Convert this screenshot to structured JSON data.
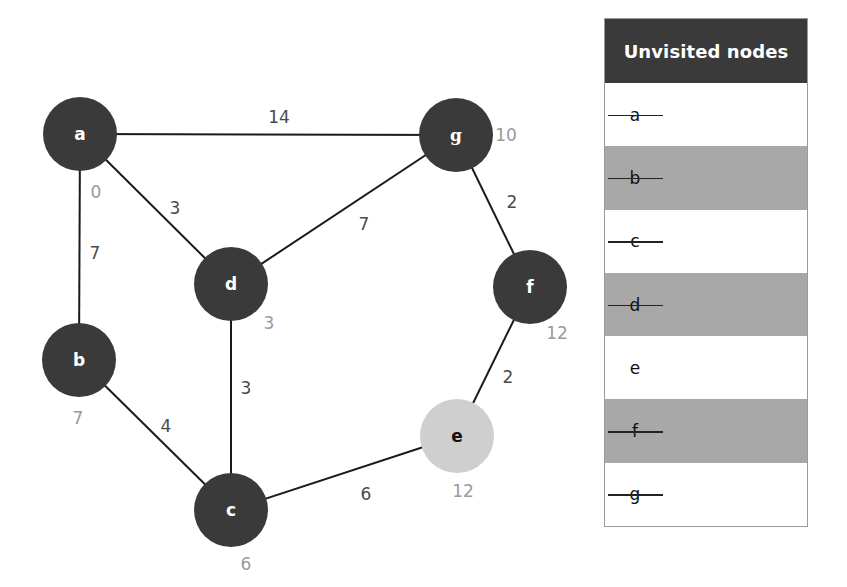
{
  "graph": {
    "nodes": [
      {
        "id": "a",
        "label": "a",
        "x": 80,
        "y": 134,
        "distance": "0",
        "dist_x": 96,
        "dist_y": 198,
        "state": "visited"
      },
      {
        "id": "b",
        "label": "b",
        "x": 79,
        "y": 360,
        "distance": "7",
        "dist_x": 78,
        "dist_y": 424,
        "state": "visited"
      },
      {
        "id": "c",
        "label": "c",
        "x": 231,
        "y": 510,
        "distance": "6",
        "dist_x": 246,
        "dist_y": 570,
        "state": "visited"
      },
      {
        "id": "d",
        "label": "d",
        "x": 231,
        "y": 284,
        "distance": "3",
        "dist_x": 269,
        "dist_y": 329,
        "state": "visited"
      },
      {
        "id": "e",
        "label": "e",
        "x": 457,
        "y": 436,
        "distance": "12",
        "dist_x": 463,
        "dist_y": 497,
        "state": "current"
      },
      {
        "id": "f",
        "label": "f",
        "x": 530,
        "y": 287,
        "distance": "12",
        "dist_x": 557,
        "dist_y": 339,
        "state": "visited"
      },
      {
        "id": "g",
        "label": "g",
        "x": 456,
        "y": 135,
        "distance": "10",
        "dist_x": 506,
        "dist_y": 141,
        "state": "visited"
      }
    ],
    "edges": [
      {
        "from": "a",
        "to": "g",
        "weight": "14",
        "label_x": 279,
        "label_y": 123
      },
      {
        "from": "a",
        "to": "d",
        "weight": "3",
        "label_x": 175,
        "label_y": 214
      },
      {
        "from": "a",
        "to": "b",
        "weight": "7",
        "label_x": 95,
        "label_y": 259
      },
      {
        "from": "d",
        "to": "g",
        "weight": "7",
        "label_x": 364,
        "label_y": 230
      },
      {
        "from": "g",
        "to": "f",
        "weight": "2",
        "label_x": 512,
        "label_y": 208
      },
      {
        "from": "d",
        "to": "c",
        "weight": "3",
        "label_x": 246,
        "label_y": 394
      },
      {
        "from": "b",
        "to": "c",
        "weight": "4",
        "label_x": 166,
        "label_y": 432
      },
      {
        "from": "f",
        "to": "e",
        "weight": "2",
        "label_x": 508,
        "label_y": 383
      },
      {
        "from": "c",
        "to": "e",
        "weight": "6",
        "label_x": 366,
        "label_y": 500
      }
    ],
    "node_radius": 37,
    "colors": {
      "visited_fill": "#3a3a3a",
      "current_fill": "#cfcfcf",
      "edge": "#1a1a1a",
      "weight_text": "#4a4a4a",
      "distance_text": "#9a9a9a"
    }
  },
  "table": {
    "header": "Unvisited nodes",
    "rows": [
      {
        "label": "a",
        "struck": true,
        "shaded": false
      },
      {
        "label": "b",
        "struck": true,
        "shaded": true
      },
      {
        "label": "c",
        "struck": true,
        "shaded": false
      },
      {
        "label": "d",
        "struck": true,
        "shaded": true
      },
      {
        "label": "e",
        "struck": false,
        "shaded": false
      },
      {
        "label": "f",
        "struck": true,
        "shaded": true
      },
      {
        "label": "g",
        "struck": true,
        "shaded": false
      }
    ],
    "colors": {
      "header_bg": "#3a3a3a",
      "shaded_row": "#a8a8a8"
    }
  }
}
